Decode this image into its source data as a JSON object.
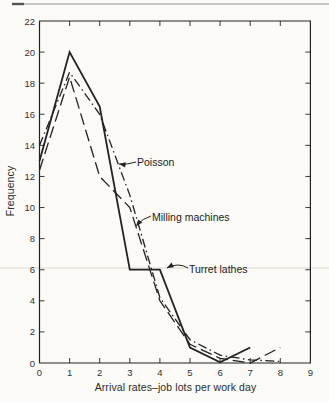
{
  "page": {
    "background": "#fbfaf7",
    "ink_color": "#222222",
    "tick_text_color": "#333333",
    "artifact_line_color": "#dcd8d1",
    "top_rule_color": "#8f8f8f"
  },
  "chart_data": {
    "type": "line",
    "title": "",
    "xlabel": "Arrival rates–job lots per work day",
    "ylabel": "Frequency",
    "xlim": [
      0,
      9
    ],
    "ylim": [
      0,
      22
    ],
    "xticks": [
      0,
      1,
      2,
      3,
      4,
      5,
      6,
      7,
      8,
      9
    ],
    "yticks": [
      0,
      2,
      4,
      6,
      8,
      10,
      12,
      14,
      16,
      18,
      20,
      22
    ],
    "grid": false,
    "frame": "full-box-inward-ticks",
    "legend": "arrow-annotations-on-plot",
    "series": [
      {
        "name": "Poisson",
        "line_style": "dash-dot",
        "x": [
          0,
          1,
          2,
          3,
          4,
          5,
          6,
          7,
          8
        ],
        "values": [
          14,
          18.7,
          16,
          10.8,
          4.2,
          1.5,
          0.5,
          0.2,
          0.1
        ]
      },
      {
        "name": "Milling machines",
        "line_style": "long-dash",
        "x": [
          0,
          1,
          2,
          3,
          4,
          5,
          6,
          7,
          8
        ],
        "values": [
          12.4,
          18.4,
          12,
          10,
          4,
          1.2,
          0.3,
          0,
          1
        ]
      },
      {
        "name": "Turret lathes",
        "line_style": "solid",
        "x": [
          0,
          1,
          2,
          3,
          4,
          5,
          6,
          7
        ],
        "values": [
          13,
          20,
          16.5,
          6,
          6,
          1,
          0.05,
          1
        ]
      }
    ],
    "annotations": [
      {
        "label": "Poisson",
        "text_px": [
          137,
          156
        ],
        "arrow_pts": [
          [
            136,
            162
          ],
          [
            127,
            165
          ],
          [
            119,
            164
          ]
        ]
      },
      {
        "label": "Milling machines",
        "text_px": [
          152,
          211
        ],
        "arrow_pts": [
          [
            151,
            216
          ],
          [
            143,
            218
          ],
          [
            136,
            226
          ]
        ]
      },
      {
        "label": "Turret lathes",
        "text_px": [
          189,
          263
        ],
        "arrow_pts": [
          [
            188,
            268
          ],
          [
            178,
            262
          ],
          [
            167,
            268
          ]
        ]
      }
    ]
  }
}
